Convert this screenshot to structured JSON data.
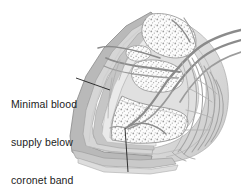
{
  "figure": {
    "background_color": "#ffffff",
    "text_color": "#1c1c1c"
  },
  "labels": {
    "minimal_blood": {
      "name": "minimal-blood-supply-label",
      "line1": "Minimal blood",
      "line2": "supply below",
      "line3": "coronet band",
      "full_text": "Minimal blood supply below coronet band"
    },
    "terminal_arch": {
      "name": "terminal-arch-label",
      "line1": "Terminal arch",
      "full_text": "Terminal arch"
    }
  },
  "leader_lines": [
    {
      "name": "leader-line-minimal-blood",
      "from_x": 76,
      "from_y": 78,
      "to_x": 110,
      "to_y": 90
    },
    {
      "name": "leader-line-terminal-arch",
      "from_x": 128,
      "from_y": 172,
      "to_x": 125,
      "to_y": 128
    }
  ],
  "illustration": {
    "type": "anatomical-line-drawing",
    "subject": "equine hoof",
    "view": "sagittal section",
    "palette": {
      "outline": "#8e8e8e",
      "outline_dark": "#6f6f6f",
      "wall_band_light": "#e6e6e6",
      "wall_band_mid": "#d0d0d0",
      "wall_band_dark": "#b4b4b4",
      "corium": "#c4c4c4",
      "bone_fill": "#fbfbfb",
      "bone_stipple": "#9a9a9a",
      "vessel": "#909090",
      "vessel_dark": "#787878",
      "soft_tissue": "#dcdcdc",
      "sole_band": "#cfcfcf"
    },
    "structures": [
      {
        "name": "hoof-wall",
        "description": "layered keratin wall, outer margin"
      },
      {
        "name": "coronet-band",
        "description": "upper hoof wall junction"
      },
      {
        "name": "coffin-bone",
        "description": "distal phalanx, trabecular"
      },
      {
        "name": "navicular-bone",
        "description": "distal sesamoid"
      },
      {
        "name": "short-pastern-bone",
        "description": "middle phalanx, upper"
      },
      {
        "name": "terminal-arch",
        "description": "arterial arch within coffin bone"
      },
      {
        "name": "digital-artery",
        "description": "major vessel entering from upper right"
      },
      {
        "name": "heel-bulb-vessels",
        "description": "fine branching vessels at heel"
      },
      {
        "name": "sole",
        "description": "banded ground surface layers"
      }
    ]
  }
}
